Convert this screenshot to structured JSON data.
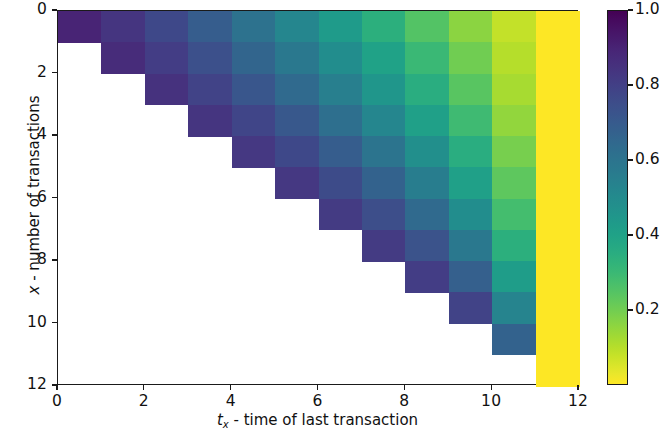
{
  "chart_data": {
    "type": "heatmap",
    "title": "",
    "xlabel": "t_x - time of last transaction",
    "ylabel": "x - number of transactions",
    "xlabel_parts": {
      "sym": "t",
      "sub": "x",
      "rest": " - time of last transaction"
    },
    "ylabel_parts": {
      "sym": "x",
      "rest": " - number of transactions"
    },
    "colormap": "viridis",
    "grid": false,
    "legend_position": "right-colorbar",
    "xlim": [
      0,
      12
    ],
    "ylim": [
      12,
      0
    ],
    "x_ticks": [
      0,
      2,
      4,
      6,
      8,
      10,
      12
    ],
    "y_ticks": [
      0,
      2,
      4,
      6,
      8,
      10,
      12
    ],
    "x_ticklabels": [
      "0",
      "2",
      "4",
      "6",
      "8",
      "10",
      "12"
    ],
    "y_ticklabels": [
      "0",
      "2",
      "4",
      "6",
      "8",
      "10",
      "12"
    ],
    "x_bins": [
      0,
      1,
      2,
      3,
      4,
      5,
      6,
      7,
      8,
      9,
      10,
      11,
      12
    ],
    "y_bins": [
      0,
      1,
      2,
      3,
      4,
      5,
      6,
      7,
      8,
      9,
      10,
      11,
      12
    ],
    "colorbar": {
      "vmin": 0.0,
      "vmax": 1.0,
      "ticks": [
        0.2,
        0.4,
        0.6,
        0.8,
        1.0
      ],
      "ticklabels": [
        "0.2",
        "0.4",
        "0.6",
        "0.8",
        "1.0"
      ]
    },
    "masked_value": null,
    "masked_color": "#ffffff",
    "note": "cells with t_x < x are masked (white); rows indexed by x (0 top .. 11 bottom), columns by t_x (0 left .. 11 right)",
    "values": [
      [
        0.1,
        0.16,
        0.23,
        0.31,
        0.39,
        0.48,
        0.57,
        0.66,
        0.75,
        0.84,
        0.92,
        1.0
      ],
      [
        null,
        0.13,
        0.19,
        0.26,
        0.34,
        0.42,
        0.51,
        0.6,
        0.7,
        0.8,
        0.9,
        1.0
      ],
      [
        null,
        null,
        0.15,
        0.21,
        0.28,
        0.36,
        0.45,
        0.55,
        0.65,
        0.76,
        0.88,
        1.0
      ],
      [
        null,
        null,
        null,
        0.16,
        0.22,
        0.29,
        0.38,
        0.48,
        0.59,
        0.71,
        0.85,
        1.0
      ],
      [
        null,
        null,
        null,
        null,
        0.17,
        0.23,
        0.31,
        0.4,
        0.52,
        0.65,
        0.81,
        1.0
      ],
      [
        null,
        null,
        null,
        null,
        null,
        0.17,
        0.24,
        0.33,
        0.44,
        0.59,
        0.77,
        1.0
      ],
      [
        null,
        null,
        null,
        null,
        null,
        null,
        0.18,
        0.25,
        0.36,
        0.51,
        0.72,
        1.0
      ],
      [
        null,
        null,
        null,
        null,
        null,
        null,
        null,
        0.18,
        0.27,
        0.42,
        0.66,
        1.0
      ],
      [
        null,
        null,
        null,
        null,
        null,
        null,
        null,
        null,
        0.19,
        0.32,
        0.58,
        1.0
      ],
      [
        null,
        null,
        null,
        null,
        null,
        null,
        null,
        null,
        null,
        0.21,
        0.47,
        1.0
      ],
      [
        null,
        null,
        null,
        null,
        null,
        null,
        null,
        null,
        null,
        null,
        0.33,
        1.0
      ],
      [
        null,
        null,
        null,
        null,
        null,
        null,
        null,
        null,
        null,
        null,
        null,
        1.0
      ]
    ]
  }
}
